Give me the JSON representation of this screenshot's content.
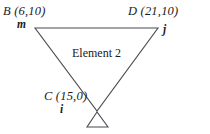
{
  "diagram": {
    "type": "triangular-finite-element",
    "element_label": "Element 2",
    "nodes": [
      {
        "id": "m",
        "point_name": "B",
        "coord_label": "B (6,10)",
        "node_label": "m",
        "x": 6,
        "y": 10,
        "px": 35,
        "py": 28
      },
      {
        "id": "j",
        "point_name": "D",
        "coord_label": "D (21,10)",
        "node_label": "j",
        "x": 21,
        "y": 10,
        "px": 158,
        "py": 28
      },
      {
        "id": "i",
        "point_name": "C",
        "coord_label": "C (15,0)",
        "node_label": "i",
        "x": 15,
        "y": 0,
        "px": 97,
        "py": 111
      }
    ],
    "support": {
      "name": "pin-support",
      "shape": "open-triangle",
      "apex_px": 97,
      "apex_py": 112,
      "base_left_px": 87,
      "base_right_px": 108,
      "base_py": 127
    },
    "colors": {
      "stroke": "#4a4a52",
      "text": "#1a1a1a",
      "background": "#ffffff"
    }
  }
}
